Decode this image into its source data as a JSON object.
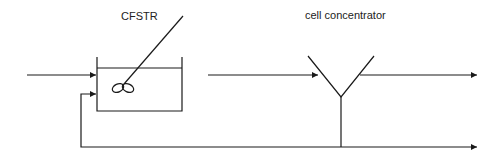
{
  "diagram": {
    "labels": {
      "reactor": "CFSTR",
      "separator": "cell concentrator"
    },
    "colors": {
      "stroke": "#1a1a1a",
      "background": "#ffffff"
    },
    "components": [
      {
        "id": "cfstr",
        "type": "stirred-tank-reactor"
      },
      {
        "id": "cell-concentrator",
        "type": "separator-y"
      }
    ],
    "streams": [
      {
        "id": "feed",
        "from": "left",
        "to": "cfstr"
      },
      {
        "id": "reactor-outlet",
        "from": "cfstr",
        "to": "cell-concentrator"
      },
      {
        "id": "product",
        "from": "cell-concentrator",
        "to": "right"
      },
      {
        "id": "recycle",
        "from": "cell-concentrator",
        "to": "cfstr"
      },
      {
        "id": "bleed",
        "from": "cell-concentrator",
        "to": "right"
      }
    ]
  }
}
